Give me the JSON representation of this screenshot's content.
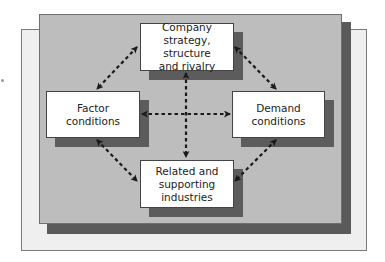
{
  "diagram": {
    "title": "",
    "nodes": [
      {
        "id": "strategy",
        "label": "Company\nstrategy, structure\nand rivalry",
        "position": "top"
      },
      {
        "id": "factor",
        "label": "Factor\nconditions",
        "position": "left"
      },
      {
        "id": "demand",
        "label": "Demand\nconditions",
        "position": "right"
      },
      {
        "id": "related",
        "label": "Related and\nsupporting\nindustries",
        "position": "bottom"
      }
    ],
    "edges": [
      {
        "from": "strategy",
        "to": "factor",
        "style": "dashed",
        "direction": "both"
      },
      {
        "from": "strategy",
        "to": "demand",
        "style": "dashed",
        "direction": "both"
      },
      {
        "from": "factor",
        "to": "related",
        "style": "dashed",
        "direction": "both"
      },
      {
        "from": "demand",
        "to": "related",
        "style": "dashed",
        "direction": "both"
      },
      {
        "from": "strategy",
        "to": "related",
        "style": "dashed",
        "direction": "both"
      },
      {
        "from": "factor",
        "to": "demand",
        "style": "dashed",
        "direction": "both"
      }
    ],
    "colors": {
      "outer_panel": "#efefef",
      "inner_panel": "#bdbdbd",
      "shadow": "#5a5a5a",
      "box": "#ffffff",
      "arrow": "#1a1a1a"
    }
  }
}
